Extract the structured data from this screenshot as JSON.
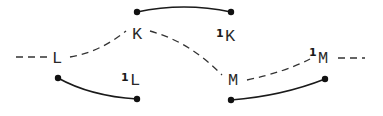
{
  "diagram": {
    "nodes": [
      {
        "id": "L",
        "label": "L",
        "prime": ""
      },
      {
        "id": "K",
        "label": "K",
        "prime": ""
      },
      {
        "id": "M",
        "label": "M",
        "prime": ""
      },
      {
        "id": "1L",
        "label": "L",
        "prime": "1"
      },
      {
        "id": "1K",
        "label": "K",
        "prime": "1"
      },
      {
        "id": "1M",
        "label": "M",
        "prime": "1"
      }
    ],
    "dashed_path": [
      "L",
      "K",
      "M",
      "1M"
    ],
    "solid_arcs": [
      {
        "near": "K",
        "to": "1K"
      },
      {
        "near": "L",
        "to": "1L"
      },
      {
        "near": "M",
        "to": "1M"
      }
    ],
    "colors": {
      "ink": "#1a1a1a",
      "background": "#ffffff"
    }
  }
}
